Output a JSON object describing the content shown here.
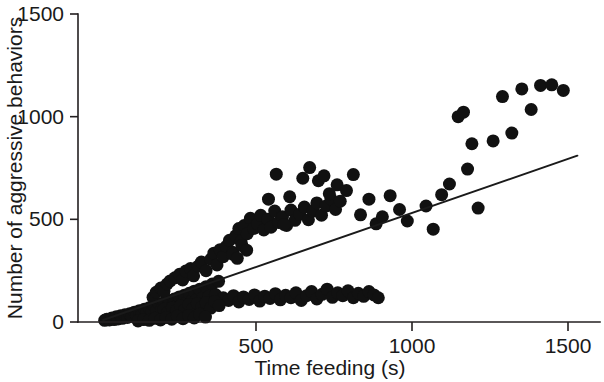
{
  "chart_data": {
    "type": "scatter",
    "title": "",
    "xlabel": "Time feeding (s)",
    "ylabel": "Number of aggressive behaviors",
    "xlim": [
      0,
      1530
    ],
    "ylim": [
      0,
      1530
    ],
    "xticks": [
      500,
      1000,
      1500
    ],
    "yticks": [
      0,
      500,
      1000,
      1500
    ],
    "xticklabels": [
      "500",
      "1000",
      "1500"
    ],
    "yticklabels": [
      "0",
      "500",
      "1000",
      "1500"
    ],
    "grid": false,
    "legend": null,
    "marker": {
      "shape": "circle",
      "color": "#111111",
      "size_px": 13
    },
    "trendline": {
      "label": "linear fit",
      "color": "#1a1a1a",
      "x_start": 10,
      "y_start": 10,
      "x_end": 1530,
      "y_end": 810
    },
    "series": [
      {
        "name": "observations",
        "points": [
          [
            15,
            8
          ],
          [
            22,
            14
          ],
          [
            30,
            10
          ],
          [
            38,
            20
          ],
          [
            45,
            12
          ],
          [
            52,
            25
          ],
          [
            58,
            15
          ],
          [
            66,
            30
          ],
          [
            72,
            18
          ],
          [
            80,
            35
          ],
          [
            88,
            22
          ],
          [
            95,
            40
          ],
          [
            102,
            28
          ],
          [
            110,
            48
          ],
          [
            118,
            32
          ],
          [
            126,
            55
          ],
          [
            134,
            38
          ],
          [
            142,
            62
          ],
          [
            150,
            44
          ],
          [
            158,
            70
          ],
          [
            166,
            50
          ],
          [
            174,
            78
          ],
          [
            182,
            56
          ],
          [
            190,
            88
          ],
          [
            198,
            62
          ],
          [
            206,
            96
          ],
          [
            214,
            68
          ],
          [
            222,
            105
          ],
          [
            230,
            74
          ],
          [
            238,
            112
          ],
          [
            246,
            80
          ],
          [
            254,
            122
          ],
          [
            262,
            88
          ],
          [
            270,
            130
          ],
          [
            278,
            96
          ],
          [
            286,
            140
          ],
          [
            294,
            102
          ],
          [
            302,
            150
          ],
          [
            310,
            110
          ],
          [
            320,
            160
          ],
          [
            330,
            118
          ],
          [
            340,
            172
          ],
          [
            350,
            126
          ],
          [
            360,
            185
          ],
          [
            370,
            134
          ],
          [
            380,
            198
          ],
          [
            170,
            120
          ],
          [
            180,
            145
          ],
          [
            195,
            165
          ],
          [
            205,
            150
          ],
          [
            215,
            185
          ],
          [
            225,
            200
          ],
          [
            240,
            215
          ],
          [
            255,
            232
          ],
          [
            265,
            205
          ],
          [
            275,
            248
          ],
          [
            290,
            260
          ],
          [
            300,
            225
          ],
          [
            315,
            272
          ],
          [
            325,
            292
          ],
          [
            340,
            250
          ],
          [
            355,
            305
          ],
          [
            365,
            335
          ],
          [
            375,
            278
          ],
          [
            385,
            352
          ],
          [
            395,
            318
          ],
          [
            405,
            368
          ],
          [
            415,
            398
          ],
          [
            425,
            340
          ],
          [
            435,
            420
          ],
          [
            445,
            455
          ],
          [
            452,
            392
          ],
          [
            462,
            470
          ],
          [
            472,
            430
          ],
          [
            482,
            505
          ],
          [
            492,
            455
          ],
          [
            505,
            478
          ],
          [
            515,
            520
          ],
          [
            525,
            448
          ],
          [
            538,
            500
          ],
          [
            548,
            462
          ],
          [
            560,
            540
          ],
          [
            572,
            485
          ],
          [
            585,
            512
          ],
          [
            598,
            470
          ],
          [
            612,
            545
          ],
          [
            625,
            495
          ],
          [
            640,
            525
          ],
          [
            655,
            560
          ],
          [
            668,
            498
          ],
          [
            682,
            540
          ],
          [
            695,
            580
          ],
          [
            710,
            520
          ],
          [
            725,
            565
          ],
          [
            740,
            600
          ],
          [
            755,
            548
          ],
          [
            770,
            588
          ],
          [
            425,
            330
          ],
          [
            440,
            310
          ],
          [
            455,
            372
          ],
          [
            470,
            350
          ],
          [
            540,
            598
          ],
          [
            565,
            720
          ],
          [
            590,
            475
          ],
          [
            608,
            610
          ],
          [
            650,
            700
          ],
          [
            672,
            752
          ],
          [
            700,
            688
          ],
          [
            718,
            712
          ],
          [
            735,
            625
          ],
          [
            760,
            668
          ],
          [
            790,
            640
          ],
          [
            812,
            718
          ],
          [
            835,
            522
          ],
          [
            862,
            598
          ],
          [
            885,
            478
          ],
          [
            905,
            512
          ],
          [
            930,
            615
          ],
          [
            960,
            548
          ],
          [
            985,
            492
          ],
          [
            1045,
            565
          ],
          [
            1068,
            452
          ],
          [
            1095,
            620
          ],
          [
            1120,
            672
          ],
          [
            1148,
            1000
          ],
          [
            1165,
            1022
          ],
          [
            1178,
            745
          ],
          [
            1192,
            868
          ],
          [
            1212,
            555
          ],
          [
            1260,
            882
          ],
          [
            1290,
            1098
          ],
          [
            1320,
            920
          ],
          [
            1352,
            1135
          ],
          [
            1382,
            1035
          ],
          [
            1412,
            1152
          ],
          [
            1448,
            1155
          ],
          [
            1485,
            1128
          ],
          [
            395,
            118
          ],
          [
            412,
            105
          ],
          [
            428,
            128
          ],
          [
            445,
            98
          ],
          [
            460,
            122
          ],
          [
            478,
            110
          ],
          [
            495,
            132
          ],
          [
            512,
            102
          ],
          [
            528,
            126
          ],
          [
            545,
            115
          ],
          [
            562,
            138
          ],
          [
            578,
            108
          ],
          [
            595,
            130
          ],
          [
            612,
            118
          ],
          [
            628,
            142
          ],
          [
            645,
            105
          ],
          [
            662,
            128
          ],
          [
            678,
            148
          ],
          [
            695,
            112
          ],
          [
            712,
            135
          ],
          [
            728,
            160
          ],
          [
            745,
            120
          ],
          [
            762,
            142
          ],
          [
            778,
            128
          ],
          [
            795,
            152
          ],
          [
            812,
            118
          ],
          [
            828,
            140
          ],
          [
            845,
            125
          ],
          [
            862,
            148
          ],
          [
            878,
            132
          ],
          [
            892,
            118
          ],
          [
            205,
            62
          ],
          [
            218,
            48
          ],
          [
            232,
            70
          ],
          [
            245,
            55
          ],
          [
            258,
            78
          ],
          [
            272,
            60
          ],
          [
            285,
            85
          ],
          [
            298,
            65
          ],
          [
            312,
            90
          ],
          [
            326,
            72
          ],
          [
            340,
            95
          ],
          [
            355,
            68
          ],
          [
            368,
            100
          ],
          [
            382,
            80
          ],
          [
            122,
            5
          ],
          [
            140,
            12
          ],
          [
            158,
            8
          ],
          [
            176,
            18
          ],
          [
            194,
            10
          ],
          [
            212,
            22
          ],
          [
            230,
            14
          ],
          [
            248,
            28
          ],
          [
            266,
            16
          ],
          [
            284,
            32
          ],
          [
            302,
            20
          ],
          [
            320,
            38
          ],
          [
            338,
            24
          ]
        ]
      }
    ]
  },
  "axes": {
    "y_axis_name": "y-axis",
    "x_axis_name": "x-axis"
  }
}
